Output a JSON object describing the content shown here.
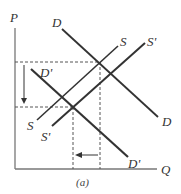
{
  "figure": {
    "caption": "(a)",
    "axes": {
      "y_label": "P",
      "x_label": "Q"
    },
    "curves": {
      "D": {
        "label_top": "D",
        "label_bottom": "D"
      },
      "D_prime": {
        "label_top": "D'",
        "label_bottom": "D'"
      },
      "S": {
        "label_top": "S",
        "label_bottom": "S"
      },
      "S_prime": {
        "label_top": "S'",
        "label_bottom": "S'"
      }
    },
    "annotations": {
      "price_change": "down arrow: price falls",
      "quantity_change": "left arrow: quantity falls"
    }
  }
}
